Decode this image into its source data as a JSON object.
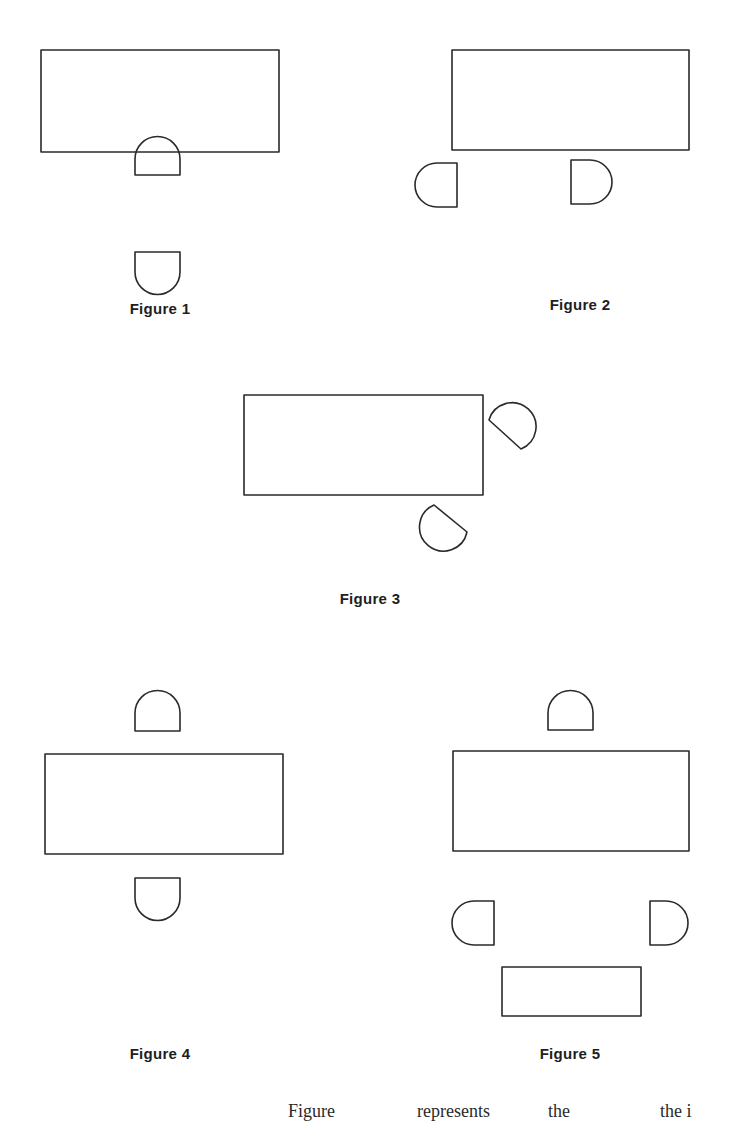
{
  "figures": [
    {
      "label": "Figure 1",
      "label_pos": [
        160,
        300
      ],
      "table": {
        "x": 41,
        "y": 50,
        "w": 238,
        "h": 102
      },
      "chairs": [
        {
          "orientation": "dome-up",
          "x": 135,
          "y": 137,
          "w": 45,
          "h": 38
        },
        {
          "orientation": "dome-down",
          "x": 135,
          "y": 252,
          "w": 45,
          "h": 43
        }
      ]
    },
    {
      "label": "Figure 2",
      "label_pos": [
        580,
        296
      ],
      "table": {
        "x": 452,
        "y": 50,
        "w": 237,
        "h": 100
      },
      "chairs": [
        {
          "orientation": "dome-left",
          "x": 415,
          "y": 163,
          "w": 42,
          "h": 44
        },
        {
          "orientation": "dome-right",
          "x": 571,
          "y": 160,
          "w": 40,
          "h": 44
        }
      ]
    },
    {
      "label": "Figure 3",
      "label_pos": [
        370,
        590
      ],
      "table": {
        "x": 244,
        "y": 395,
        "w": 239,
        "h": 100
      },
      "chairs": [
        {
          "orientation": "rotated-flat-down-left",
          "cx": 515,
          "cy": 422,
          "size": 44,
          "rotation": -135
        },
        {
          "orientation": "rotated-flat-up-right",
          "cx": 440,
          "cy": 533,
          "size": 44,
          "rotation": 45
        }
      ]
    },
    {
      "label": "Figure 4",
      "label_pos": [
        160,
        1045
      ],
      "table": {
        "x": 45,
        "y": 754,
        "w": 238,
        "h": 100
      },
      "chairs": [
        {
          "orientation": "dome-up",
          "x": 135,
          "y": 691,
          "w": 45,
          "h": 40
        },
        {
          "orientation": "dome-down",
          "x": 135,
          "y": 878,
          "w": 45,
          "h": 43
        }
      ]
    },
    {
      "label": "Figure 5",
      "label_pos": [
        570,
        1045
      ],
      "table": {
        "x": 453,
        "y": 751,
        "w": 236,
        "h": 100
      },
      "chairs": [
        {
          "orientation": "dome-up",
          "x": 548,
          "y": 691,
          "w": 45,
          "h": 39
        },
        {
          "orientation": "dome-left",
          "x": 452,
          "y": 901,
          "w": 42,
          "h": 44
        },
        {
          "orientation": "dome-right",
          "x": 650,
          "y": 901,
          "w": 38,
          "h": 44
        }
      ],
      "side_table": {
        "x": 502,
        "y": 967,
        "w": 139,
        "h": 49
      }
    }
  ],
  "footer_text": {
    "fragments": [
      {
        "text": "Figure",
        "x": 288
      },
      {
        "text": "represents",
        "x": 417
      },
      {
        "text": "the",
        "x": 548
      },
      {
        "text": "the i",
        "x": 660
      }
    ]
  }
}
